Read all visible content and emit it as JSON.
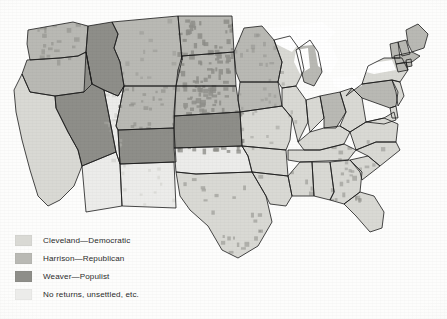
{
  "figure": {
    "kind": "choropleth-map",
    "region": "United States",
    "background_color": "#fdfdfc",
    "border_color": "#1a1a1a"
  },
  "palette": {
    "democratic": "#d9d9d4",
    "republican": "#b9b9b4",
    "populist": "#8e8e89",
    "no_returns": "#ececea",
    "water": "#ffffff",
    "outline": "#1b1b1b"
  },
  "legend": {
    "items": [
      {
        "label": "Cleveland—Democratic",
        "color_key": "democratic",
        "color": "#d9d9d4"
      },
      {
        "label": "Harrison—Republican",
        "color_key": "republican",
        "color": "#b9b9b4"
      },
      {
        "label": "Weaver—Populist",
        "color_key": "populist",
        "color": "#8e8e89"
      },
      {
        "label": "No returns, unsettled, etc.",
        "color_key": "no_returns",
        "color": "#ececea"
      }
    ]
  },
  "chart_data": {
    "type": "map",
    "title": "",
    "legend_position": "bottom-left",
    "categories": [
      "Cleveland—Democratic",
      "Harrison—Republican",
      "Weaver—Populist",
      "No returns, unsettled, etc."
    ],
    "regions": [
      {
        "name": "Washington",
        "category": "Harrison—Republican"
      },
      {
        "name": "Oregon",
        "category": "Harrison—Republican"
      },
      {
        "name": "California",
        "category": "Cleveland—Democratic"
      },
      {
        "name": "Nevada",
        "category": "Weaver—Populist"
      },
      {
        "name": "Idaho",
        "category": "Weaver—Populist"
      },
      {
        "name": "Montana",
        "category": "Harrison—Republican"
      },
      {
        "name": "Wyoming",
        "category": "Harrison—Republican"
      },
      {
        "name": "Utah",
        "category": "No returns, unsettled, etc."
      },
      {
        "name": "Arizona",
        "category": "No returns, unsettled, etc."
      },
      {
        "name": "New Mexico",
        "category": "No returns, unsettled, etc."
      },
      {
        "name": "Colorado",
        "category": "Weaver—Populist"
      },
      {
        "name": "North Dakota",
        "category": "Harrison—Republican"
      },
      {
        "name": "South Dakota",
        "category": "Harrison—Republican"
      },
      {
        "name": "Nebraska",
        "category": "Harrison—Republican"
      },
      {
        "name": "Kansas",
        "category": "Weaver—Populist"
      },
      {
        "name": "Oklahoma",
        "category": "No returns, unsettled, etc."
      },
      {
        "name": "Texas",
        "category": "Cleveland—Democratic"
      },
      {
        "name": "Minnesota",
        "category": "Harrison—Republican"
      },
      {
        "name": "Iowa",
        "category": "Harrison—Republican"
      },
      {
        "name": "Missouri",
        "category": "Cleveland—Democratic"
      },
      {
        "name": "Arkansas",
        "category": "Cleveland—Democratic"
      },
      {
        "name": "Louisiana",
        "category": "Cleveland—Democratic"
      },
      {
        "name": "Wisconsin",
        "category": "Cleveland—Democratic"
      },
      {
        "name": "Illinois",
        "category": "Cleveland—Democratic"
      },
      {
        "name": "Michigan",
        "category": "Harrison—Republican"
      },
      {
        "name": "Indiana",
        "category": "Cleveland—Democratic"
      },
      {
        "name": "Ohio",
        "category": "Harrison—Republican"
      },
      {
        "name": "Kentucky",
        "category": "Cleveland—Democratic"
      },
      {
        "name": "Tennessee",
        "category": "Cleveland—Democratic"
      },
      {
        "name": "Mississippi",
        "category": "Cleveland—Democratic"
      },
      {
        "name": "Alabama",
        "category": "Cleveland—Democratic"
      },
      {
        "name": "Georgia",
        "category": "Cleveland—Democratic"
      },
      {
        "name": "Florida",
        "category": "Cleveland—Democratic"
      },
      {
        "name": "South Carolina",
        "category": "Cleveland—Democratic"
      },
      {
        "name": "North Carolina",
        "category": "Cleveland—Democratic"
      },
      {
        "name": "Virginia",
        "category": "Cleveland—Democratic"
      },
      {
        "name": "West Virginia",
        "category": "Cleveland—Democratic"
      },
      {
        "name": "Maryland",
        "category": "Cleveland—Democratic"
      },
      {
        "name": "Delaware",
        "category": "Cleveland—Democratic"
      },
      {
        "name": "Pennsylvania",
        "category": "Harrison—Republican"
      },
      {
        "name": "New Jersey",
        "category": "Cleveland—Democratic"
      },
      {
        "name": "New York",
        "category": "Cleveland—Democratic"
      },
      {
        "name": "Connecticut",
        "category": "Harrison—Republican"
      },
      {
        "name": "Rhode Island",
        "category": "Harrison—Republican"
      },
      {
        "name": "Massachusetts",
        "category": "Harrison—Republican"
      },
      {
        "name": "Vermont",
        "category": "Harrison—Republican"
      },
      {
        "name": "New Hampshire",
        "category": "Harrison—Republican"
      },
      {
        "name": "Maine",
        "category": "Harrison—Republican"
      }
    ]
  }
}
